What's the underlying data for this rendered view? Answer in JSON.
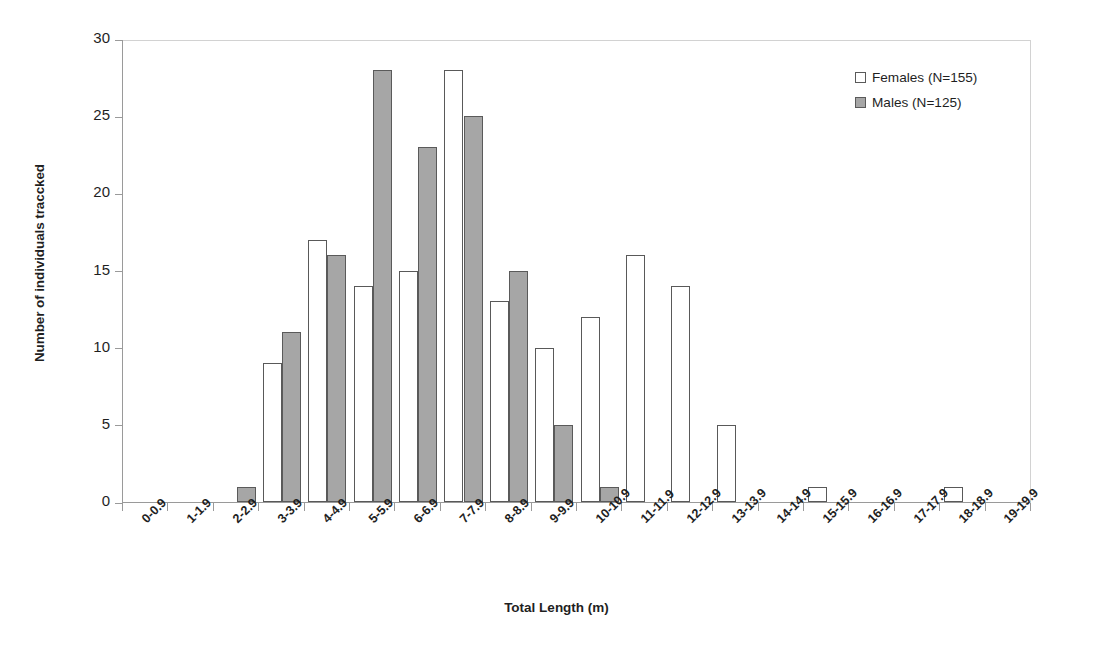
{
  "chart_data": {
    "type": "bar",
    "title": "",
    "xlabel": "Total Length (m)",
    "ylabel": "Number of individuals traccked",
    "ylim": [
      0,
      30
    ],
    "yticks": [
      0,
      5,
      10,
      15,
      20,
      25,
      30
    ],
    "grid": false,
    "legend_position": "top-right",
    "categories": [
      "0-0.9",
      "1-1.9",
      "2-2.9",
      "3-3.9",
      "4-4.9",
      "5-5.9",
      "6-6.9",
      "7-7.9",
      "8-8.9",
      "9-9.9",
      "10-10.9",
      "11-11.9",
      "12-12.9",
      "13-13.9",
      "14-14.9",
      "15-15.9",
      "16-16.9",
      "17-17.9",
      "18-18.9",
      "19-19.9"
    ],
    "series": [
      {
        "name": "Females (N=155)",
        "color": "#ffffff",
        "edge_color": "#595959",
        "values": [
          0,
          0,
          0,
          9,
          17,
          14,
          15,
          28,
          13,
          10,
          12,
          16,
          14,
          5,
          0,
          1,
          0,
          0,
          1,
          0
        ]
      },
      {
        "name": "Males (N=125)",
        "color": "#a6a6a6",
        "edge_color": "#5a5a5a",
        "values": [
          0,
          0,
          1,
          11,
          16,
          28,
          23,
          25,
          15,
          5,
          1,
          0,
          0,
          0,
          0,
          0,
          0,
          0,
          0,
          0
        ]
      }
    ]
  },
  "legend": {
    "items": [
      {
        "label": "Females (N=155)",
        "swatch": "white-square-icon"
      },
      {
        "label": "Males (N=125)",
        "swatch": "gray-square-icon"
      }
    ]
  },
  "axes": {
    "y_title": "Number of individuals traccked",
    "x_title": "Total Length (m)",
    "y_tick_labels": [
      "0",
      "5",
      "10",
      "15",
      "20",
      "25",
      "30"
    ]
  }
}
